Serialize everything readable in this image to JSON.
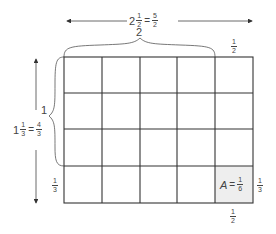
{
  "diagram": {
    "top_dimension": {
      "whole": "2",
      "num": "1",
      "den": "2",
      "eq": "=",
      "improper_num": "5",
      "improper_den": "2"
    },
    "top_brace_label": "2",
    "top_right_fraction": {
      "num": "1",
      "den": "2"
    },
    "left_dimension": {
      "whole": "1",
      "num": "1",
      "den": "3",
      "eq": "=",
      "improper_num": "4",
      "improper_den": "3"
    },
    "left_brace_label": "1",
    "left_bottom_fraction": {
      "num": "1",
      "den": "3"
    },
    "cell_area": {
      "var": "A",
      "eq": "=",
      "num": "1",
      "den": "6"
    },
    "right_fraction": {
      "num": "1",
      "den": "3"
    },
    "bottom_fraction": {
      "num": "1",
      "den": "2"
    },
    "grid": {
      "columns": 5,
      "rows": 4,
      "shaded_cell": "bottom-right"
    },
    "colors": {
      "line": "#333333",
      "shade": "#eeeeee"
    }
  }
}
